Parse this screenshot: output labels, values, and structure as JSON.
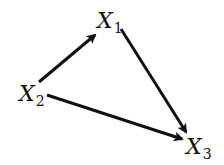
{
  "diagram": {
    "type": "directed-graph",
    "nodes": [
      {
        "id": "X1",
        "base": "X",
        "sub": "1",
        "x": 97,
        "y": 10
      },
      {
        "id": "X2",
        "base": "X",
        "sub": "2",
        "x": 19,
        "y": 83
      },
      {
        "id": "X3",
        "base": "X",
        "sub": "3",
        "x": 186,
        "y": 136
      }
    ],
    "edges": [
      {
        "from": "X2",
        "to": "X1",
        "x1": 39,
        "y1": 82,
        "x2": 95,
        "y2": 35
      },
      {
        "from": "X1",
        "to": "X3",
        "x1": 121,
        "y1": 29,
        "x2": 186,
        "y2": 132
      },
      {
        "from": "X2",
        "to": "X3",
        "x1": 47,
        "y1": 95,
        "x2": 182,
        "y2": 139
      }
    ],
    "colors": {
      "edge": "#111111",
      "text": "#111111",
      "background": "#ffffff"
    }
  }
}
